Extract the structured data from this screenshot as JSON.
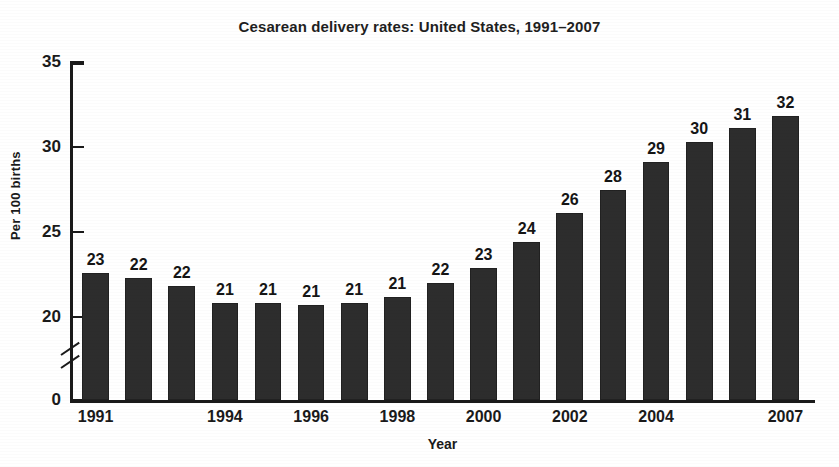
{
  "chart_data": {
    "type": "bar",
    "title": "Cesarean delivery rates: United States, 1991–2007",
    "xlabel": "Year",
    "ylabel": "Per 100 births",
    "categories": [
      "1991",
      "1992",
      "1993",
      "1994",
      "1995",
      "1996",
      "1997",
      "1998",
      "1999",
      "2000",
      "2001",
      "2002",
      "2003",
      "2004",
      "2005",
      "2006",
      "2007"
    ],
    "values": [
      22.6,
      22.3,
      21.8,
      20.8,
      20.8,
      20.7,
      20.8,
      21.2,
      22.0,
      22.9,
      24.4,
      26.1,
      27.5,
      29.1,
      30.3,
      31.1,
      31.8
    ],
    "data_labels": [
      "23",
      "22",
      "22",
      "21",
      "21",
      "21",
      "21",
      "21",
      "22",
      "23",
      "24",
      "26",
      "28",
      "29",
      "30",
      "31",
      "32"
    ],
    "tick_labels_x": [
      "1991",
      "1994",
      "1996",
      "1998",
      "2000",
      "2002",
      "2004",
      "2007"
    ],
    "tick_label_indices_x": [
      0,
      3,
      5,
      7,
      9,
      11,
      13,
      16
    ],
    "yticks": [
      0,
      20,
      25,
      30,
      35
    ],
    "ytick_labels": [
      "0",
      "20",
      "25",
      "30",
      "35"
    ],
    "ylim": [
      0,
      35
    ],
    "axis_break": true,
    "axis_break_between": [
      0,
      20
    ],
    "grid": false,
    "legend": false,
    "bar_color": "#2d2d2d",
    "axis_color": "#1a1a1a",
    "background_color": "#ffffff"
  }
}
